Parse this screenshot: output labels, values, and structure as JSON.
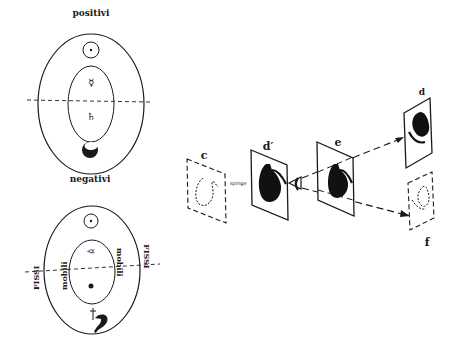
{
  "figure": {
    "left_top": {
      "label_top": "positivi",
      "label_bottom": "negativi",
      "symbols": {
        "sun": "⊙",
        "mercury": "☿",
        "saturn": "♄",
        "moon": "moon"
      }
    },
    "left_bottom": {
      "label_left_outer": "FISSI",
      "label_left_inner": "mobili",
      "label_right_inner": "mobili",
      "label_right_outer": "FISSI",
      "symbols": {
        "sun": "⊙",
        "mercury": "☿",
        "dot": "•",
        "saturn": "♄"
      }
    },
    "right": {
      "panels": [
        {
          "id": "c",
          "label": "c",
          "style": "dashed"
        },
        {
          "id": "d_prime",
          "label": "d′",
          "style": "solid"
        },
        {
          "id": "e",
          "label": "e",
          "style": "solid"
        },
        {
          "id": "d",
          "label": "d",
          "style": "solid"
        },
        {
          "id": "f",
          "label": "f",
          "style": "dashed"
        }
      ],
      "arrow_label": "spinge",
      "eye": "eye"
    }
  }
}
